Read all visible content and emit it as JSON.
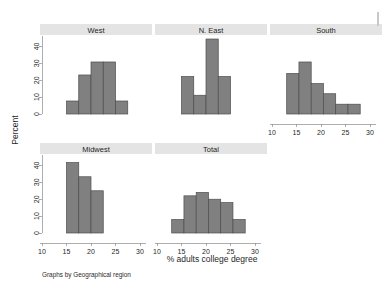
{
  "figure": {
    "ylabel": "Percent",
    "xlabel": "% adults college degree",
    "caption": "Graphs by Geographical region",
    "bar_fill": "#808080",
    "bar_stroke": "#4d4d4d",
    "strip_fill": "#e4e4e4",
    "axis_color": "#8c8c8c"
  },
  "chart_data": {
    "type": "bar",
    "title": "",
    "subtitle": "",
    "xlabel": "% adults college degree",
    "ylabel": "Percent",
    "caption": "Graphs by Geographical region",
    "note": "Small-multiples histogram (Stata by-graph) of percent of adults with a college degree, by geographical region",
    "xlim": [
      10,
      30
    ],
    "ylim": [
      0,
      45
    ],
    "xticks": [
      10,
      15,
      20,
      25,
      30
    ],
    "xtick_labels": [
      "10",
      "15",
      "20",
      "25",
      "30"
    ],
    "yticks": [
      0,
      10,
      20,
      30,
      40
    ],
    "ytick_labels": [
      "0",
      "10",
      "20",
      "30",
      "40"
    ],
    "grid": false,
    "legend": false,
    "bin_width": 2.5,
    "panels": [
      {
        "label": "West",
        "row": 0,
        "col": 0,
        "bins": [
          {
            "x0": 15.0,
            "x1": 17.5,
            "value": 7.7
          },
          {
            "x0": 17.5,
            "x1": 20.0,
            "value": 23.1
          },
          {
            "x0": 20.0,
            "x1": 22.5,
            "value": 30.8
          },
          {
            "x0": 22.5,
            "x1": 25.0,
            "value": 30.8
          },
          {
            "x0": 25.0,
            "x1": 27.5,
            "value": 7.7
          }
        ]
      },
      {
        "label": "N. East",
        "row": 0,
        "col": 1,
        "bins": [
          {
            "x0": 15.0,
            "x1": 17.5,
            "value": 22.2
          },
          {
            "x0": 17.5,
            "x1": 20.0,
            "value": 11.1
          },
          {
            "x0": 20.0,
            "x1": 22.5,
            "value": 44.4
          },
          {
            "x0": 22.5,
            "x1": 25.0,
            "value": 22.2
          }
        ]
      },
      {
        "label": "South",
        "row": 0,
        "col": 2,
        "bins": [
          {
            "x0": 13.0,
            "x1": 15.5,
            "value": 24.0
          },
          {
            "x0": 15.5,
            "x1": 18.0,
            "value": 30.8
          },
          {
            "x0": 18.0,
            "x1": 20.5,
            "value": 18.0
          },
          {
            "x0": 20.5,
            "x1": 23.0,
            "value": 12.0
          },
          {
            "x0": 23.0,
            "x1": 25.5,
            "value": 5.8
          },
          {
            "x0": 25.5,
            "x1": 28.0,
            "value": 5.8
          }
        ]
      },
      {
        "label": "Midwest",
        "row": 1,
        "col": 0,
        "bins": [
          {
            "x0": 15.0,
            "x1": 17.5,
            "value": 41.7
          },
          {
            "x0": 17.5,
            "x1": 20.0,
            "value": 33.3
          },
          {
            "x0": 20.0,
            "x1": 22.5,
            "value": 25.0
          }
        ]
      },
      {
        "label": "Total",
        "row": 1,
        "col": 1,
        "bins": [
          {
            "x0": 13.0,
            "x1": 15.5,
            "value": 8.0
          },
          {
            "x0": 15.5,
            "x1": 18.0,
            "value": 22.0
          },
          {
            "x0": 18.0,
            "x1": 20.5,
            "value": 24.0
          },
          {
            "x0": 20.5,
            "x1": 23.0,
            "value": 20.0
          },
          {
            "x0": 23.0,
            "x1": 25.5,
            "value": 18.0
          },
          {
            "x0": 25.5,
            "x1": 28.0,
            "value": 8.0
          }
        ]
      }
    ]
  }
}
